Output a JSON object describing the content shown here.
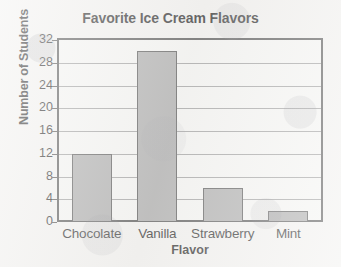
{
  "chart_data": {
    "type": "bar",
    "title": "Favorite Ice Cream Flavors",
    "xlabel": "Flavor",
    "ylabel": "Number of Students",
    "categories": [
      "Chocolate",
      "Vanilla",
      "Strawberry",
      "Mint"
    ],
    "values": [
      12,
      30,
      6,
      2
    ],
    "ylim": [
      0,
      32
    ],
    "yticks": [
      0,
      4,
      8,
      12,
      16,
      20,
      24,
      28,
      32
    ],
    "ytick_labels": [
      "0",
      "4",
      "8",
      "12",
      "16",
      "20",
      "24",
      "28",
      "32"
    ],
    "grid": true,
    "grid_axis": "y",
    "legend": null,
    "legend_position": "none",
    "bar_color": "#a7a7a7",
    "bar_edge_color": "#4c4c4c",
    "axis_color": "#4a4a4a",
    "gridline_color": "#9a9a9a",
    "background_color": "#f2f1ef",
    "annotations": []
  }
}
